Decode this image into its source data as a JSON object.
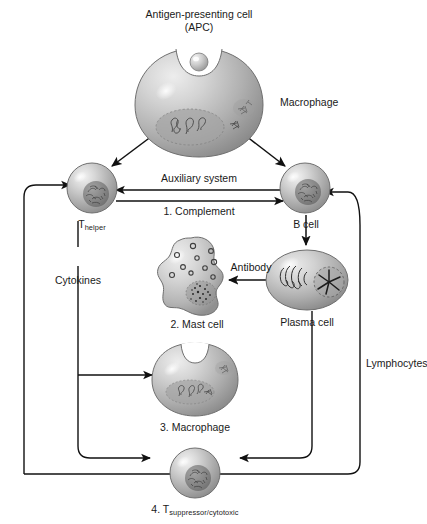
{
  "figure": {
    "title_line1": "Antigen-presenting cell",
    "title_line2": "(APC)",
    "background_color": "#ffffff",
    "line_color": "#111111",
    "cell_fill_light": "#e6e6e6",
    "cell_fill_mid": "#b3b3b3",
    "cell_fill_dark": "#8a8a8a"
  },
  "labels": {
    "macrophage_top": "Macrophage",
    "t_helper_main": "T",
    "t_helper_sub": "helper",
    "b_cell": "B cell",
    "auxiliary_system": "Auxiliary system",
    "complement": "1. Complement",
    "cytokines": "Cytokines",
    "antibody": "Antibody",
    "mast_cell": "2. Mast cell",
    "plasma_cell": "Plasma cell",
    "macrophage_bottom": "3. Macrophage",
    "t_sup_prefix": "4. T",
    "t_sup_sub": "suppressor/cytotoxic",
    "lymphocytes": "Lymphocytes"
  },
  "cells": [
    {
      "name": "apc-macrophage",
      "label": "Macrophage",
      "shape": "notched-sphere",
      "cx": 199,
      "cy": 103
    },
    {
      "name": "t-helper-lymphocyte",
      "label": "T helper",
      "shape": "sphere",
      "cx": 92,
      "cy": 188
    },
    {
      "name": "b-cell-lymphocyte",
      "label": "B cell",
      "shape": "sphere",
      "cx": 305,
      "cy": 188
    },
    {
      "name": "mast-cell",
      "label": "2. Mast cell",
      "shape": "blob",
      "cx": 195,
      "cy": 279
    },
    {
      "name": "plasma-cell",
      "label": "Plasma cell",
      "shape": "ellipse",
      "cx": 307,
      "cy": 280
    },
    {
      "name": "macrophage-effector",
      "label": "3. Macrophage",
      "shape": "notched-sphere",
      "cx": 195,
      "cy": 379
    },
    {
      "name": "t-suppressor-lymphocyte",
      "label": "4. T suppressor/cytotoxic",
      "shape": "sphere",
      "cx": 195,
      "cy": 473
    }
  ],
  "connections": [
    {
      "name": "apc-to-thelper",
      "from": "apc-macrophage",
      "to": "t-helper-lymphocyte",
      "style": "arrow"
    },
    {
      "name": "apc-to-bcell",
      "from": "apc-macrophage",
      "to": "b-cell-lymphocyte",
      "style": "arrow"
    },
    {
      "name": "bcell-to-thelper",
      "from": "b-cell-lymphocyte",
      "to": "t-helper-lymphocyte",
      "label": "Auxiliary system",
      "style": "arrow"
    },
    {
      "name": "thelper-to-bcell",
      "from": "t-helper-lymphocyte",
      "to": "b-cell-lymphocyte",
      "label": "1. Complement",
      "style": "arrow"
    },
    {
      "name": "bcell-to-plasma",
      "from": "b-cell-lymphocyte",
      "to": "plasma-cell",
      "style": "arrow"
    },
    {
      "name": "plasma-to-mast",
      "from": "plasma-cell",
      "to": "mast-cell",
      "label": "Antibody",
      "style": "arrow"
    },
    {
      "name": "thelper-cytokines",
      "from": "t-helper-lymphocyte",
      "to": "macrophage-effector",
      "label": "Cytokines",
      "style": "arrow"
    },
    {
      "name": "cytokines-to-tsup",
      "from": "t-helper-lymphocyte",
      "to": "t-suppressor-lymphocyte",
      "style": "arrow"
    },
    {
      "name": "plasma-to-tsup",
      "from": "plasma-cell",
      "to": "t-suppressor-lymphocyte",
      "style": "arrow"
    },
    {
      "name": "lymphocytes-feedback-right",
      "from": "t-suppressor-lymphocyte",
      "to": "b-cell-lymphocyte",
      "label": "Lymphocytes",
      "style": "arrow"
    },
    {
      "name": "lymphocytes-feedback-left",
      "from": "t-suppressor-lymphocyte",
      "to": "t-helper-lymphocyte",
      "style": "arrow"
    }
  ]
}
